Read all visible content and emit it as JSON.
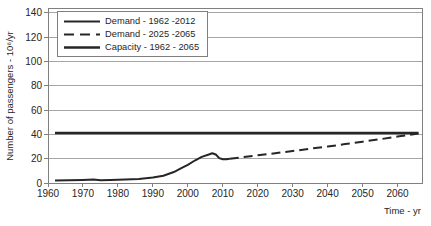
{
  "chart_data": {
    "type": "line",
    "title": "",
    "xlabel": "Time - yr",
    "ylabel": "Number of passengers - 10⁶/yr",
    "xlim": [
      1960,
      2067
    ],
    "ylim": [
      0,
      144
    ],
    "x_ticks": [
      1960,
      1970,
      1980,
      1990,
      2000,
      2010,
      2020,
      2030,
      2040,
      2050,
      2060
    ],
    "y_ticks": [
      0,
      20,
      40,
      60,
      80,
      100,
      120,
      140
    ],
    "grid": "horizontal-major",
    "legend_position": "top-left-inside",
    "colors": {
      "line": "#262626",
      "grid": "#a6a6a6",
      "border": "#808080",
      "text": "#262626",
      "background": "#ffffff"
    },
    "series": [
      {
        "name": "Demand - 1962 -2012",
        "style": "solid",
        "width": 2,
        "x": [
          1962,
          1966,
          1970,
          1973,
          1975,
          1978,
          1982,
          1986,
          1990,
          1993,
          1996,
          1998,
          2000,
          2002,
          2004,
          2006,
          2007,
          2008,
          2009,
          2010,
          2011,
          2012
        ],
        "y": [
          2,
          2.2,
          2.5,
          2.8,
          2.2,
          2.5,
          2.8,
          3.2,
          4.5,
          6,
          9,
          12,
          15,
          18.5,
          21.5,
          23.5,
          24.5,
          23.5,
          20.5,
          19.5,
          19.5,
          20
        ]
      },
      {
        "name": "Demand - 2025 -2065",
        "style": "dashed",
        "width": 2,
        "x": [
          2012,
          2015,
          2020,
          2025,
          2030,
          2035,
          2040,
          2045,
          2050,
          2055,
          2060,
          2066
        ],
        "y": [
          20,
          21,
          22.8,
          24.5,
          26.3,
          28.2,
          30,
          32,
          34,
          36,
          38.2,
          40.8
        ]
      },
      {
        "name": "Capacity - 1962 - 2065",
        "style": "solid",
        "width": 2.5,
        "x": [
          1962,
          2066
        ],
        "y": [
          41.2,
          41.2
        ]
      }
    ]
  }
}
